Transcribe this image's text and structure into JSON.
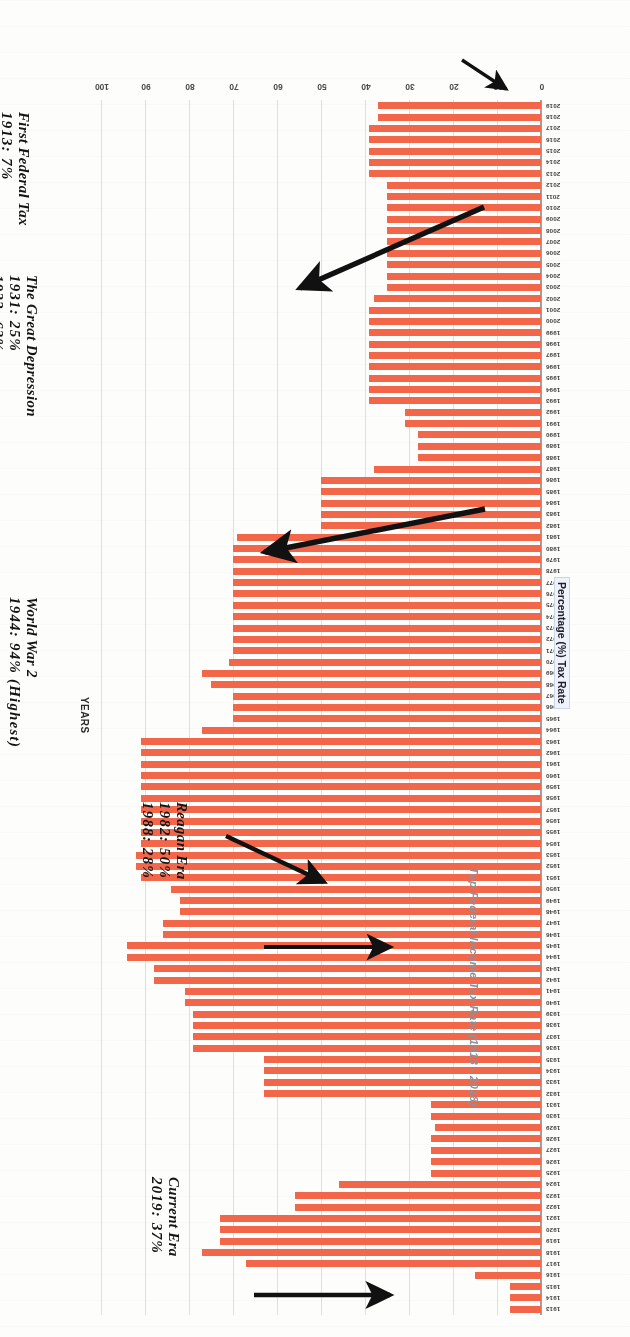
{
  "chart_data": {
    "type": "bar",
    "orientation": "horizontal",
    "title": "Top Federal Income Tax Rate (1913 - 2018)",
    "xlabel": "Percentage (%) Tax Rate",
    "ylabel": "YEARS",
    "xlim": [
      0,
      100
    ],
    "xticks": [
      0,
      10,
      20,
      30,
      40,
      50,
      60,
      70,
      80,
      90,
      100
    ],
    "grid": true,
    "legend": "none",
    "bar_color": "#F2674A",
    "categories": [
      "1913",
      "1914",
      "1915",
      "1916",
      "1917",
      "1918",
      "1919",
      "1920",
      "1921",
      "1922",
      "1923",
      "1924",
      "1925",
      "1926",
      "1927",
      "1928",
      "1929",
      "1930",
      "1931",
      "1932",
      "1933",
      "1934",
      "1935",
      "1936",
      "1937",
      "1938",
      "1939",
      "1940",
      "1941",
      "1942",
      "1943",
      "1944",
      "1945",
      "1946",
      "1947",
      "1948",
      "1949",
      "1950",
      "1951",
      "1952",
      "1953",
      "1954",
      "1955",
      "1956",
      "1957",
      "1958",
      "1959",
      "1960",
      "1961",
      "1962",
      "1963",
      "1964",
      "1965",
      "1966",
      "1967",
      "1968",
      "1969",
      "1970",
      "1971",
      "1972",
      "1973",
      "1974",
      "1975",
      "1976",
      "1977",
      "1978",
      "1979",
      "1980",
      "1981",
      "1982",
      "1983",
      "1984",
      "1985",
      "1986",
      "1987",
      "1988",
      "1989",
      "1990",
      "1991",
      "1992",
      "1993",
      "1994",
      "1995",
      "1996",
      "1997",
      "1998",
      "1999",
      "2000",
      "2001",
      "2002",
      "2003",
      "2004",
      "2005",
      "2006",
      "2007",
      "2008",
      "2009",
      "2010",
      "2011",
      "2012",
      "2013",
      "2014",
      "2015",
      "2016",
      "2017",
      "2018",
      "2019"
    ],
    "values": [
      7,
      7,
      7,
      15,
      67,
      77,
      73,
      73,
      73,
      56,
      56,
      46,
      25,
      25,
      25,
      25,
      24,
      25,
      25,
      63,
      63,
      63,
      63,
      79,
      79,
      79,
      79,
      81,
      81,
      88,
      88,
      94,
      94,
      86,
      86,
      82,
      82,
      84,
      91,
      92,
      92,
      91,
      91,
      91,
      91,
      91,
      91,
      91,
      91,
      91,
      91,
      77,
      70,
      70,
      70,
      75,
      77,
      71,
      70,
      70,
      70,
      70,
      70,
      70,
      70,
      70,
      70,
      70,
      69,
      50,
      50,
      50,
      50,
      50,
      38,
      28,
      28,
      28,
      31,
      31,
      39,
      39,
      39,
      39,
      39,
      39,
      39,
      39,
      39,
      38,
      35,
      35,
      35,
      35,
      35,
      35,
      35,
      35,
      35,
      35,
      39,
      39,
      39,
      39,
      39,
      37,
      37
    ],
    "annotations": [
      {
        "id": "first-federal-tax",
        "heading": "First Federal Tax",
        "lines": [
          "1913: 7%"
        ],
        "points_to_year": "1913",
        "points_to_value": 7
      },
      {
        "id": "great-depression",
        "heading": "The Great Depression",
        "lines": [
          "1931: 25%",
          "1932: 63%"
        ],
        "points_to_year": "1932",
        "points_to_value": 63
      },
      {
        "id": "world-war-2",
        "heading": "World War 2",
        "lines": [
          "1944: 94% (Highest)"
        ],
        "points_to_year": "1944",
        "points_to_value": 94
      },
      {
        "id": "reagan-era",
        "heading": "Reagan Era",
        "lines": [
          "1982: 50%",
          "1988: 28%"
        ],
        "points_to_year": "1982",
        "points_to_value": 50
      },
      {
        "id": "current-era",
        "heading": "Current Era",
        "lines": [
          "2019: 37%"
        ],
        "points_to_year": "2019",
        "points_to_value": 37
      }
    ]
  },
  "colors": {
    "bar": "#F2674A",
    "title_text": "#8d9199",
    "axis_text": "#3a3a3a",
    "annotation_text": "#141414",
    "grid": "#b9bcc4",
    "page_background": "#fdfdfb"
  },
  "annotation_text": {
    "first_federal_tax_heading": "First Federal Tax",
    "first_federal_tax_line1": "1913: 7%",
    "great_depression_heading": "The Great Depression",
    "great_depression_line1": "1931: 25%",
    "great_depression_line2": "1932: 63%",
    "world_war_2_heading": "World War 2",
    "world_war_2_line1": "1944: 94% (Highest)",
    "reagan_era_heading": "Reagan Era",
    "reagan_era_line1": "1982: 50%",
    "reagan_era_line2": "1988: 28%",
    "current_era_heading": "Current Era",
    "current_era_line1": "2019: 37%"
  },
  "axis_labels": {
    "x_title": "Percentage (%) Tax Rate",
    "y_title": "YEARS",
    "chart_title": "Top Federal Income Tax Rate (1913 - 2018)"
  }
}
